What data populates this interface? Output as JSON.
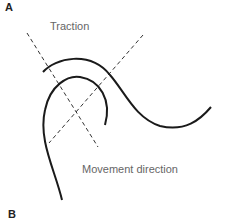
{
  "panels": {
    "top_label": "A",
    "bottom_label": "B"
  },
  "labels": {
    "traction": "Traction",
    "movement": "Movement direction"
  },
  "colors": {
    "curve": "#1a1a1a",
    "dashed": "#333333",
    "text": "#666666"
  }
}
